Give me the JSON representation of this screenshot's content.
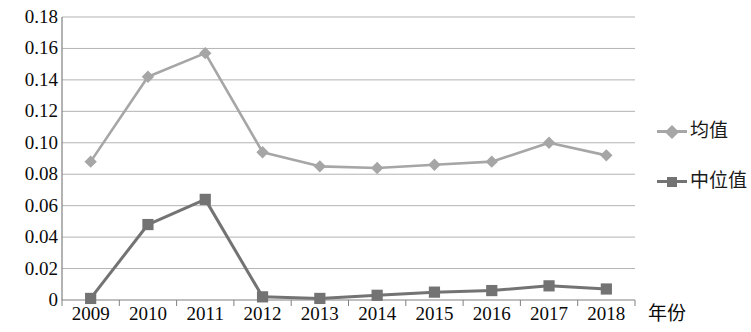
{
  "chart_data": {
    "type": "line",
    "title": "",
    "subtitle": "",
    "xlabel": "年份",
    "ylabel": "",
    "categories": [
      "2009",
      "2010",
      "2011",
      "2012",
      "2013",
      "2014",
      "2015",
      "2016",
      "2017",
      "2018"
    ],
    "series": [
      {
        "name": "均值",
        "color": "#a6a6a6",
        "marker": "diamond",
        "values": [
          0.088,
          0.142,
          0.157,
          0.094,
          0.085,
          0.084,
          0.086,
          0.088,
          0.1,
          0.092
        ]
      },
      {
        "name": "中位值",
        "color": "#737373",
        "marker": "square",
        "values": [
          0.001,
          0.048,
          0.064,
          0.002,
          0.001,
          0.003,
          0.005,
          0.006,
          0.009,
          0.007
        ]
      }
    ],
    "ylim": [
      0,
      0.18
    ],
    "ytick_values": [
      0,
      0.02,
      0.04,
      0.06,
      0.08,
      0.1,
      0.12,
      0.14,
      0.16,
      0.18
    ],
    "ytick_labels": [
      "0",
      "0.02",
      "0.04",
      "0.06",
      "0.08",
      "0.10",
      "0.12",
      "0.14",
      "0.16",
      "0.18"
    ],
    "grid": true,
    "grid_color": "#b3b3b3",
    "axis_color": "#808080",
    "legend_position": "right",
    "background": "#ffffff"
  },
  "legend": {
    "entries": [
      {
        "label": "均值"
      },
      {
        "label": "中位值"
      }
    ]
  },
  "axes": {
    "x_title": "年份"
  }
}
